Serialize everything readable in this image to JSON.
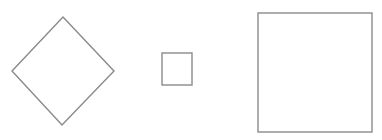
{
  "canvas": {
    "width": 382,
    "height": 140,
    "background": "#ffffff"
  },
  "style": {
    "stroke": "#8a8a8a",
    "stroke_width": 1.4,
    "fill": "#ffffff"
  },
  "shapes": [
    {
      "id": "diamond",
      "type": "polygon",
      "points": "63,17 114,71 62,125 12,71"
    },
    {
      "id": "small-square",
      "type": "rect",
      "x": 162,
      "y": 53,
      "width": 30,
      "height": 32
    },
    {
      "id": "large-square",
      "type": "rect",
      "x": 258,
      "y": 13,
      "width": 114,
      "height": 119
    }
  ]
}
